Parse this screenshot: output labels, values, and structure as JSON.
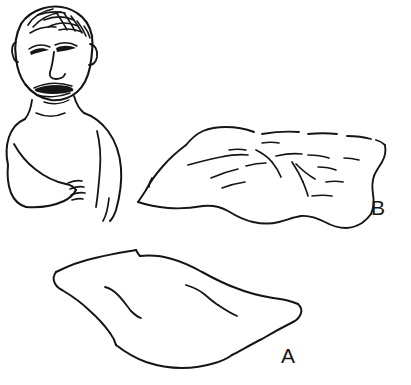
{
  "canvas": {
    "width": 411,
    "height": 385,
    "background_color": "#ffffff",
    "ink_color": "#151515",
    "medium": "pen-line-drawing"
  },
  "figures": [
    {
      "id": "child",
      "data_name": "child-figure",
      "description": "Line drawing of a young child, head and bare torso, arms folded across the chest, looking down and to the left",
      "parts": [
        "hair",
        "face",
        "eyes",
        "nose",
        "mouth",
        "ears",
        "neck",
        "shoulders",
        "torso",
        "left-arm",
        "right-arm",
        "hand"
      ],
      "position": {
        "x": 8,
        "y": 6,
        "width": 125,
        "height": 215
      }
    },
    {
      "id": "blanket-b",
      "data_name": "blanket-b",
      "label": "B",
      "description": "Flat rumpled sheet or blanket drawn in perspective with many creases and wrinkles across the surface",
      "wrinkle_count": 14,
      "position": {
        "x": 136,
        "y": 124,
        "width": 250,
        "height": 110
      }
    },
    {
      "id": "blanket-a",
      "data_name": "blanket-a",
      "label": "A",
      "description": "Flat smooth sheet or blanket drawn in perspective with only two faint creases",
      "wrinkle_count": 2,
      "position": {
        "x": 53,
        "y": 246,
        "width": 255,
        "height": 120
      }
    }
  ],
  "labels": [
    {
      "text": "B",
      "x": 371,
      "y": 215,
      "data_name": "label-b"
    },
    {
      "text": "A",
      "x": 281,
      "y": 363,
      "data_name": "label-a"
    }
  ]
}
